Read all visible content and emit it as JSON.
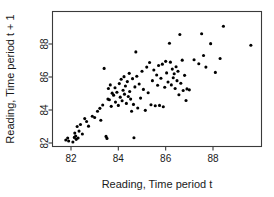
{
  "chart_data": {
    "type": "scatter",
    "title": "",
    "xlabel": "Reading, Time period t",
    "ylabel": "Reading, Time period t + 1",
    "xticks": [
      82,
      84,
      86,
      88
    ],
    "yticks": [
      82,
      84,
      86,
      88
    ],
    "xtick_labels": [
      "82",
      "84",
      "86",
      "88"
    ],
    "ytick_labels": [
      "82",
      "84",
      "86",
      "88"
    ],
    "xlim": [
      81.2,
      90.0
    ],
    "ylim": [
      81.2,
      89.2
    ],
    "grid": false,
    "legend": null,
    "marker": "filled-circle",
    "marker_color": "#000000",
    "marker_size_px": 3.1,
    "n_points": 112,
    "points": [
      [
        81.6,
        81.65
      ],
      [
        81.78,
        82.18
      ],
      [
        81.86,
        82.3
      ],
      [
        81.9,
        82.12
      ],
      [
        82.02,
        81.55
      ],
      [
        82.08,
        82.06
      ],
      [
        82.14,
        82.34
      ],
      [
        82.16,
        82.6
      ],
      [
        82.2,
        82.42
      ],
      [
        82.22,
        82.22
      ],
      [
        82.26,
        83.0
      ],
      [
        82.3,
        82.3
      ],
      [
        82.34,
        82.72
      ],
      [
        82.4,
        83.12
      ],
      [
        82.48,
        82.55
      ],
      [
        82.58,
        83.48
      ],
      [
        82.66,
        83.3
      ],
      [
        82.74,
        83.02
      ],
      [
        82.9,
        83.62
      ],
      [
        83.0,
        83.55
      ],
      [
        83.12,
        83.92
      ],
      [
        83.22,
        84.1
      ],
      [
        83.26,
        83.38
      ],
      [
        83.34,
        84.3
      ],
      [
        83.4,
        86.52
      ],
      [
        83.48,
        82.4
      ],
      [
        83.52,
        82.28
      ],
      [
        83.56,
        84.66
      ],
      [
        83.58,
        85.3
      ],
      [
        83.62,
        84.62
      ],
      [
        83.66,
        85.52
      ],
      [
        83.7,
        84.22
      ],
      [
        83.74,
        85.02
      ],
      [
        83.8,
        84.9
      ],
      [
        83.86,
        85.35
      ],
      [
        83.88,
        84.48
      ],
      [
        83.94,
        85.08
      ],
      [
        84.0,
        84.28
      ],
      [
        84.04,
        85.6
      ],
      [
        84.08,
        84.78
      ],
      [
        84.12,
        85.86
      ],
      [
        84.16,
        84.56
      ],
      [
        84.2,
        85.2
      ],
      [
        84.24,
        86.02
      ],
      [
        84.26,
        84.96
      ],
      [
        84.3,
        85.45
      ],
      [
        84.34,
        84.4
      ],
      [
        84.38,
        85.72
      ],
      [
        84.42,
        84.82
      ],
      [
        84.46,
        86.22
      ],
      [
        84.48,
        85.12
      ],
      [
        84.52,
        84.66
      ],
      [
        84.56,
        83.92
      ],
      [
        84.6,
        85.9
      ],
      [
        84.64,
        84.34
      ],
      [
        84.66,
        82.32
      ],
      [
        84.7,
        85.4
      ],
      [
        84.74,
        87.52
      ],
      [
        84.78,
        86.05
      ],
      [
        84.82,
        84.12
      ],
      [
        84.88,
        85.58
      ],
      [
        84.94,
        84.72
      ],
      [
        85.0,
        86.35
      ],
      [
        85.06,
        85.25
      ],
      [
        85.14,
        83.98
      ],
      [
        85.2,
        86.6
      ],
      [
        85.26,
        85.05
      ],
      [
        85.32,
        86.88
      ],
      [
        85.38,
        84.32
      ],
      [
        85.44,
        85.78
      ],
      [
        85.5,
        86.42
      ],
      [
        85.56,
        84.26
      ],
      [
        85.62,
        86.12
      ],
      [
        85.66,
        85.5
      ],
      [
        85.7,
        86.7
      ],
      [
        85.74,
        84.28
      ],
      [
        85.8,
        85.92
      ],
      [
        85.86,
        86.78
      ],
      [
        85.9,
        84.2
      ],
      [
        85.96,
        85.38
      ],
      [
        86.0,
        86.95
      ],
      [
        86.04,
        86.25
      ],
      [
        86.1,
        85.7
      ],
      [
        86.16,
        88.05
      ],
      [
        86.2,
        86.9
      ],
      [
        86.24,
        85.52
      ],
      [
        86.28,
        86.48
      ],
      [
        86.32,
        85.95
      ],
      [
        86.36,
        86.2
      ],
      [
        86.4,
        85.3
      ],
      [
        86.44,
        86.62
      ],
      [
        86.48,
        85.78
      ],
      [
        86.52,
        86.35
      ],
      [
        86.56,
        84.92
      ],
      [
        86.6,
        88.58
      ],
      [
        86.64,
        85.62
      ],
      [
        86.7,
        87.02
      ],
      [
        86.74,
        85.18
      ],
      [
        86.8,
        86.1
      ],
      [
        86.86,
        84.58
      ],
      [
        86.9,
        85.28
      ],
      [
        87.0,
        85.22
      ],
      [
        87.2,
        87.05
      ],
      [
        87.4,
        86.8
      ],
      [
        87.52,
        88.62
      ],
      [
        87.6,
        87.3
      ],
      [
        87.7,
        86.6
      ],
      [
        87.9,
        88.02
      ],
      [
        88.1,
        86.28
      ],
      [
        88.3,
        87.12
      ],
      [
        88.44,
        89.08
      ],
      [
        89.6,
        87.92
      ]
    ]
  }
}
